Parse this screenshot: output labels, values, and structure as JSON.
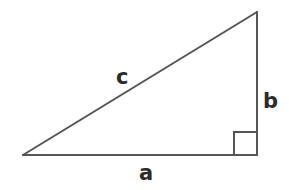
{
  "diagram": {
    "stroke_color": "#555555",
    "label_color": "#2b2b2b",
    "background": "#ffffff",
    "vertices": {
      "left": {
        "x": 23,
        "y": 155
      },
      "right_angle": {
        "x": 257,
        "y": 155
      },
      "top": {
        "x": 257,
        "y": 12
      }
    },
    "right_angle_marker": {
      "x": 234,
      "y": 132,
      "size": 23
    },
    "labels": {
      "hypotenuse": "c",
      "vertical_leg": "b",
      "horizontal_leg": "a"
    }
  }
}
